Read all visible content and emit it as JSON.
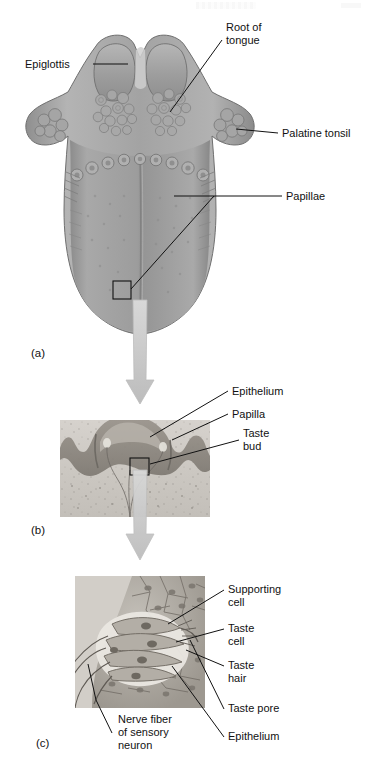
{
  "figure": {
    "panels": [
      {
        "id": "a",
        "id_label": "(a)",
        "caption": "Dorsal surface of the tongue"
      },
      {
        "id": "b",
        "id_label": "(b)",
        "caption": "Section through a papilla"
      },
      {
        "id": "c",
        "id_label": "(c)",
        "caption": "Taste bud detail"
      }
    ]
  },
  "panel_a": {
    "id_label": "(a)",
    "labels": [
      {
        "name": "epiglottis",
        "text": "Epiglottis"
      },
      {
        "name": "root-of-tongue",
        "text": "Root of\ntongue",
        "line1": "Root of",
        "line2": "tongue"
      },
      {
        "name": "palatine-tonsil",
        "text": "Palatine tonsil"
      },
      {
        "name": "papillae",
        "text": "Papillae"
      }
    ]
  },
  "panel_b": {
    "id_label": "(b)",
    "labels": [
      {
        "name": "epithelium",
        "text": "Epithelium"
      },
      {
        "name": "papilla",
        "text": "Papilla"
      },
      {
        "name": "taste-bud",
        "line1": "Taste",
        "line2": "bud"
      }
    ]
  },
  "panel_c": {
    "id_label": "(c)",
    "labels": [
      {
        "name": "supporting-cell",
        "line1": "Supporting",
        "line2": "cell"
      },
      {
        "name": "taste-cell",
        "line1": "Taste",
        "line2": "cell"
      },
      {
        "name": "taste-hair",
        "line1": "Taste",
        "line2": "hair"
      },
      {
        "name": "taste-pore",
        "text": "Taste pore"
      },
      {
        "name": "epithelium",
        "text": "Epithelium"
      },
      {
        "name": "nerve-fiber",
        "line1": "Nerve fiber",
        "line2": "of sensory",
        "line3": "neuron"
      }
    ]
  },
  "colors": {
    "background": "#ffffff",
    "text": "#111111",
    "leader": "#111111",
    "tongue_light": "#b9b9b9",
    "tongue_mid": "#9a9a9a",
    "tongue_dark": "#7d7d7d",
    "arrow": "#c9c9c9",
    "histology_bg": "#cfcbc6",
    "epithelium_dark": "#8c8780"
  }
}
